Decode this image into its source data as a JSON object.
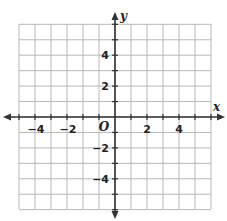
{
  "diagram": {
    "type": "coordinate-plane",
    "x_axis": {
      "label": "x",
      "min": -6,
      "max": 6,
      "tick_labels": [
        "−4",
        "−2",
        "2",
        "4"
      ],
      "tick_values": [
        -4,
        -2,
        2,
        4
      ]
    },
    "y_axis": {
      "label": "y",
      "min": -6,
      "max": 6,
      "tick_labels": [
        "4",
        "2",
        "−2",
        "−4"
      ],
      "tick_values": [
        4,
        2,
        -2,
        -4
      ]
    },
    "origin_label": "O",
    "grid": {
      "columns": 12,
      "rows": 12,
      "spacing_units": 1
    },
    "colors": {
      "grid": "#b8b8b8",
      "axis": "#333333",
      "text": "#222222",
      "background": "#ffffff"
    }
  }
}
